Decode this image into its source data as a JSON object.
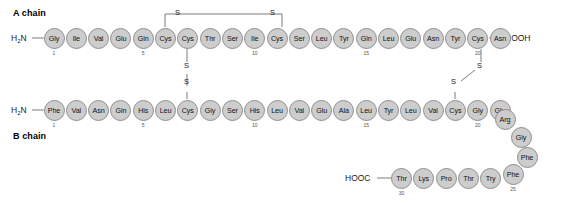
{
  "diagram": {
    "title_a": "A chain",
    "title_b": "B chain",
    "n_terminus": "H2N",
    "c_terminus_a": "COOH",
    "c_terminus_b": "HOOC",
    "sulfur_label": "S"
  },
  "a_chain": {
    "label": "A chain",
    "n_term": "H",
    "n_term_sub": "2",
    "n_term_rest": "N",
    "c_term": "COOH",
    "residues": [
      {
        "name": "Gly",
        "number": 1
      },
      {
        "name": "Ile",
        "number": 2
      },
      {
        "name": "Val",
        "number": 3
      },
      {
        "name": "Glu",
        "number": 4
      },
      {
        "name": "Gln",
        "number": 5
      },
      {
        "name": "Cys",
        "number": 6
      },
      {
        "name": "Cys",
        "number": 7
      },
      {
        "name": "Thr",
        "number": 8
      },
      {
        "name": "Ser",
        "number": 9
      },
      {
        "name": "Ile",
        "number": 10
      },
      {
        "name": "Cys",
        "number": 11
      },
      {
        "name": "Ser",
        "number": 12
      },
      {
        "name": "Leu",
        "number": 13
      },
      {
        "name": "Tyr",
        "number": 14
      },
      {
        "name": "Gln",
        "number": 15
      },
      {
        "name": "Leu",
        "number": 16
      },
      {
        "name": "Glu",
        "number": 17
      },
      {
        "name": "Asn",
        "number": 18
      },
      {
        "name": "Tyr",
        "number": 19
      },
      {
        "name": "Cys",
        "number": 20
      },
      {
        "name": "Asn",
        "number": 21
      }
    ],
    "shown_numbers": [
      1,
      5,
      10,
      15,
      20
    ]
  },
  "b_chain": {
    "label": "B chain",
    "n_term": "H",
    "n_term_sub": "2",
    "n_term_rest": "N",
    "c_term": "HOOC",
    "residues": [
      {
        "name": "Phe",
        "number": 1
      },
      {
        "name": "Val",
        "number": 2
      },
      {
        "name": "Asn",
        "number": 3
      },
      {
        "name": "Gln",
        "number": 4
      },
      {
        "name": "His",
        "number": 5
      },
      {
        "name": "Leu",
        "number": 6
      },
      {
        "name": "Cys",
        "number": 7
      },
      {
        "name": "Gly",
        "number": 8
      },
      {
        "name": "Ser",
        "number": 9
      },
      {
        "name": "His",
        "number": 10
      },
      {
        "name": "Leu",
        "number": 11
      },
      {
        "name": "Val",
        "number": 12
      },
      {
        "name": "Glu",
        "number": 13
      },
      {
        "name": "Ala",
        "number": 14
      },
      {
        "name": "Leu",
        "number": 15
      },
      {
        "name": "Tyr",
        "number": 16
      },
      {
        "name": "Leu",
        "number": 17
      },
      {
        "name": "Val",
        "number": 18
      },
      {
        "name": "Cys",
        "number": 19
      },
      {
        "name": "Gly",
        "number": 20
      },
      {
        "name": "Glu",
        "number": 21
      },
      {
        "name": "Arg",
        "number": 22
      },
      {
        "name": "Gly",
        "number": 23
      },
      {
        "name": "Phe",
        "number": 24
      },
      {
        "name": "Phe",
        "number": 25
      },
      {
        "name": "Try",
        "number": 26
      },
      {
        "name": "Thr",
        "number": 27
      },
      {
        "name": "Pro",
        "number": 28
      },
      {
        "name": "Lys",
        "number": 29
      },
      {
        "name": "Thr",
        "number": 30
      }
    ],
    "shown_numbers": [
      1,
      5,
      10,
      15,
      20,
      25,
      30
    ]
  },
  "disulfide_bonds": [
    {
      "id": "a6-a11",
      "from": "A6",
      "to": "A11",
      "type": "intrachain",
      "labels": [
        "S",
        "S"
      ]
    },
    {
      "id": "a7-b7",
      "from": "A7",
      "to": "B7",
      "type": "interchain",
      "labels": [
        "S",
        "S"
      ]
    },
    {
      "id": "a20-b19",
      "from": "A20",
      "to": "B19",
      "type": "interchain",
      "labels": [
        "S",
        "S"
      ]
    }
  ],
  "colors": {
    "residue_fill": "#cdcdcd",
    "residue_stroke": "#8e8e8e",
    "text": "#111111",
    "bond": "#7d7d7d",
    "background": "#ffffff"
  }
}
